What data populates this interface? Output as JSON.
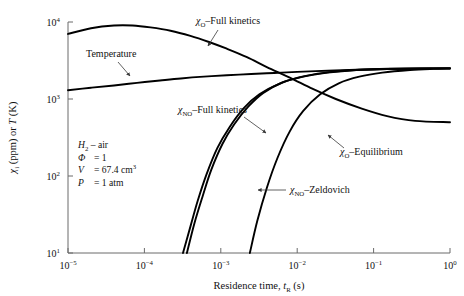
{
  "figure": {
    "background": "#ffffff",
    "curve_color": "#000000",
    "axis_color": "#6b6b6b",
    "ghost_caption": ""
  },
  "axes": {
    "x": {
      "label_main": "Residence time,",
      "label_sym": "t",
      "label_sub": "R",
      "label_unit": "(s)",
      "ticks": [
        {
          "mant": "10",
          "exp": "−5"
        },
        {
          "mant": "10",
          "exp": "−4"
        },
        {
          "mant": "10",
          "exp": "−3"
        },
        {
          "mant": "10",
          "exp": "−2"
        },
        {
          "mant": "10",
          "exp": "−1"
        },
        {
          "mant": "10",
          "exp": "0"
        }
      ],
      "min": 1e-05,
      "max": 1.0,
      "scale": "log"
    },
    "y": {
      "label_sym": "χ",
      "label_sub": "i",
      "label_rest": "(ppm) or",
      "label_sym2": "T",
      "label_unit": "(K)",
      "ticks": [
        {
          "mant": "10",
          "exp": "1"
        },
        {
          "mant": "10",
          "exp": "2"
        },
        {
          "mant": "10",
          "exp": "3"
        },
        {
          "mant": "10",
          "exp": "4"
        }
      ],
      "min": 10,
      "max": 10000,
      "scale": "log"
    }
  },
  "conditions": {
    "lines": [
      {
        "sym": "H",
        "sub": "2",
        "rest": " – air",
        "eq": "",
        "val": ""
      },
      {
        "sym": "Φ",
        "sub": "",
        "rest": "",
        "eq": "=",
        "val": "1"
      },
      {
        "sym": "V",
        "sub": "",
        "rest": "",
        "eq": "=",
        "val": "67.4 cm",
        "sup": "3"
      },
      {
        "sym": "P",
        "sub": "",
        "rest": "",
        "eq": "=",
        "val": "1 atm"
      }
    ]
  },
  "annotations": [
    {
      "id": "chi-o-full-kinetics",
      "sym": "χ",
      "sub": "O",
      "text": "–Full kinetics",
      "x": 196,
      "y": 24,
      "leader": "M 218 30 L 208 46",
      "arrow": true
    },
    {
      "id": "temperature",
      "sym": "",
      "sub": "",
      "text": "Temperature",
      "x": 86,
      "y": 57,
      "leader": "M 118 62 L 130 76",
      "arrow": true
    },
    {
      "id": "chi-no-full-kinetics",
      "sym": "χ",
      "sub": "NO",
      "text": "–Full kinetics",
      "x": 178,
      "y": 113,
      "leader": "M 244 117 L 266 133",
      "arrow": true
    },
    {
      "id": "chi-o-equilibrium",
      "sym": "χ",
      "sub": "O",
      "text": "–Equilibrium",
      "x": 340,
      "y": 155,
      "leader": "M 344 148 L 328 135",
      "arrow": true
    },
    {
      "id": "chi-no-zeldovich",
      "sym": "χ",
      "sub": "NO",
      "text": "–Zeldovich",
      "x": 290,
      "y": 193,
      "leader": "M 286 190 L 258 190",
      "arrow": true
    }
  ],
  "chart_data": {
    "type": "line",
    "title": "",
    "xlabel": "Residence time, t_R (s)",
    "ylabel": "χ_i (ppm) or T (K)",
    "xscale": "log",
    "yscale": "log",
    "xlim": [
      1e-05,
      1.0
    ],
    "ylim": [
      10,
      10000
    ],
    "grid": false,
    "legend": "inline-annotations",
    "series": [
      {
        "name": "χ_O–Full kinetics",
        "x": [
          1e-05,
          2e-05,
          4e-05,
          7e-05,
          0.00012,
          0.00022,
          0.0004,
          0.0007,
          0.0012,
          0.0022,
          0.004,
          0.008,
          0.016,
          0.032,
          0.07,
          0.15,
          0.35,
          1.0
        ],
        "y": [
          7000,
          8300,
          9000,
          9000,
          8500,
          7700,
          6600,
          5500,
          4500,
          3500,
          2600,
          1900,
          1350,
          1000,
          750,
          600,
          520,
          500
        ]
      },
      {
        "name": "Temperature",
        "x": [
          1e-05,
          2e-05,
          4e-05,
          8e-05,
          0.00016,
          0.0003,
          0.0006,
          0.0012,
          0.0025,
          0.005,
          0.01,
          0.025,
          0.06,
          0.15,
          0.4,
          1.0
        ],
        "y": [
          1300,
          1400,
          1500,
          1620,
          1740,
          1850,
          1950,
          2030,
          2110,
          2180,
          2250,
          2330,
          2400,
          2450,
          2480,
          2500
        ]
      },
      {
        "name": "χ_NO–Full kinetics",
        "x": [
          0.00032,
          0.0004,
          0.0005,
          0.00065,
          0.0009,
          0.0013,
          0.002,
          0.0032,
          0.006,
          0.012,
          0.025,
          0.06,
          0.15,
          0.4,
          1.0
        ],
        "y": [
          10,
          22,
          48,
          105,
          230,
          430,
          760,
          1150,
          1600,
          1950,
          2200,
          2380,
          2450,
          2490,
          2500
        ]
      },
      {
        "name": "χ_O–Equilibrium",
        "x": [
          0.00036,
          0.00045,
          0.00058,
          0.00075,
          0.00105,
          0.0015,
          0.0023,
          0.0036,
          0.0065,
          0.013,
          0.028,
          0.065,
          0.16,
          0.4,
          1.0
        ],
        "y": [
          10,
          24,
          55,
          120,
          260,
          470,
          800,
          1200,
          1650,
          2000,
          2250,
          2400,
          2470,
          2495,
          2500
        ]
      },
      {
        "name": "χ_NO–Zeldovich",
        "x": [
          0.0024,
          0.003,
          0.004,
          0.0055,
          0.008,
          0.012,
          0.02,
          0.035,
          0.065,
          0.13,
          0.3,
          0.6,
          1.0
        ],
        "y": [
          10,
          26,
          70,
          170,
          380,
          700,
          1150,
          1600,
          1950,
          2200,
          2380,
          2460,
          2490
        ]
      }
    ]
  }
}
